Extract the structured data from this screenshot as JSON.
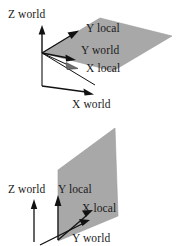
{
  "figure": {
    "background_color": "#ffffff",
    "plane_fill_color": "#a8a8a8",
    "plane_stroke_color": "#8a8a8a",
    "axis_color": "#111111",
    "text_color": "#1a1a1a"
  },
  "diagrams": [
    {
      "id": "top",
      "name": "horizontal-plane-diagram",
      "labels": {
        "z_world": "Z world",
        "y_local": "Y local",
        "y_world": "Y world",
        "x_local": "X local",
        "x_world": "X world"
      }
    },
    {
      "id": "bottom",
      "name": "vertical-plane-diagram",
      "labels": {
        "z_world": "Z world",
        "y_local": "Y local",
        "x_local": "X local",
        "y_world": "Y world"
      }
    }
  ]
}
